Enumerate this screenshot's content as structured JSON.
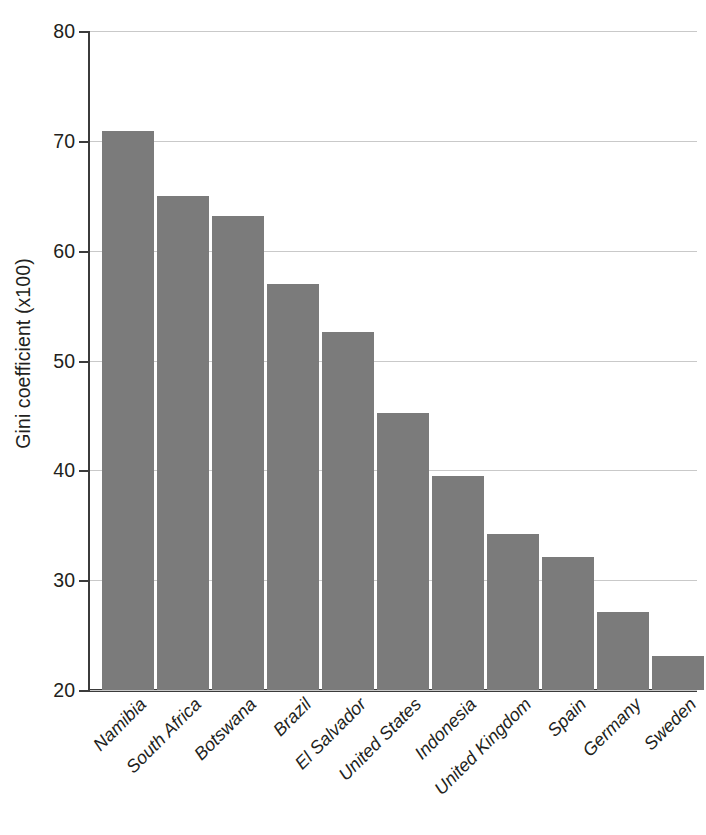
{
  "chart_data": {
    "type": "bar",
    "title": "",
    "subtitle": "",
    "xlabel": "",
    "ylabel": "Gini coefficient (x100)",
    "categories": [
      "Namibia",
      "South Africa",
      "Botswana",
      "Brazil",
      "El Salvador",
      "United States",
      "Indonesia",
      "United Kingdom",
      "Spain",
      "Germany",
      "Sweden"
    ],
    "values": [
      70.9,
      65.0,
      63.2,
      57.0,
      52.6,
      45.2,
      39.5,
      34.2,
      32.1,
      27.1,
      23.1
    ],
    "ylim": [
      20,
      80
    ],
    "ytick_labels": [
      "80",
      "70",
      "60",
      "50",
      "40",
      "30",
      "20"
    ],
    "ytick_values": [
      80,
      70,
      60,
      50,
      40,
      30,
      20
    ],
    "grid": true,
    "legend": null,
    "bar_color": "#7b7b7b",
    "gridline_color": "#c9c9c9",
    "axis_color": "#3b3b3b"
  }
}
